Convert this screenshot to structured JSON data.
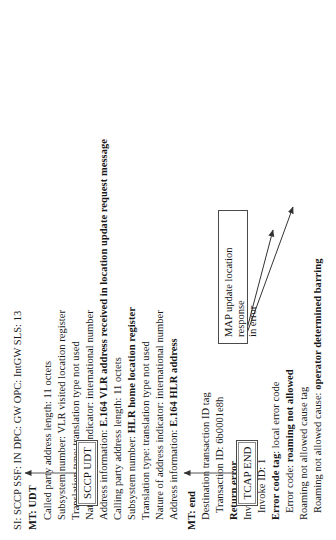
{
  "figure": {
    "orientation": "rotated-90-ccw",
    "ink_color": "#171717",
    "rule_color": "#4a4a4a"
  },
  "boxes": {
    "sccp_udt": "SCCP UDT",
    "tcap_end": "TCAP END",
    "callout_line1": "MAP update location response",
    "callout_line2": "in error"
  },
  "sccp_block": {
    "header": "SI: SCCP  SSF: IN   DPC: GW  OPC: IntGW   SLS: 13",
    "message_type": "MT: UDT",
    "called_party": {
      "address_length": "Called party address length: 11 octets",
      "subsystem_number": "Subsystem number: VLR visited location register",
      "translation_type": "Translation type: translation type not used",
      "nature_of_address": "Nature of address indicator: international number",
      "address_information_label": "Address information: ",
      "address_information_value": "E.164 VLR address received in location update request message"
    },
    "calling_party": {
      "address_length": "Calling party address length: 11 octets",
      "subsystem_number_label": "Subsystem number: ",
      "subsystem_number_value": "HLR home location register",
      "translation_type": "Translation type: translation type not used",
      "nature_of_address": "Nature of address indicator: international number",
      "address_information_label": "Address information: ",
      "address_information_value": "E.164 HLR address"
    }
  },
  "tcap_block": {
    "message_type": "MT: end",
    "destination_transaction_id_tag": "Destination transaction ID tag",
    "transaction_id": "Transaction ID: 6b0001e8h",
    "return_error": "Return error",
    "invoke_id_tag": "Invoke ID tag",
    "invoke_id": "Invoke ID: 1",
    "error_code_tag_label": "Error code tag",
    "error_code_tag_value": ": local error code",
    "error_code_label": "Error code: ",
    "error_code_value": "roaming not allowed",
    "roaming_cause_tag": "Roaming not allowed cause tag",
    "roaming_cause_label": "Roaming not allowed cause: ",
    "roaming_cause_value": "operator determined barring"
  }
}
